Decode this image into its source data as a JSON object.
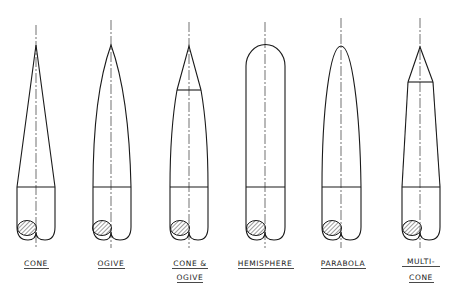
{
  "diagram": {
    "title": "",
    "shapes": [
      {
        "id": "cone",
        "label_lines": [
          "CONE"
        ],
        "nose_type": "cone"
      },
      {
        "id": "ogive",
        "label_lines": [
          "OGIVE"
        ],
        "nose_type": "ogive"
      },
      {
        "id": "cone-ogive",
        "label_lines": [
          "CONE &",
          "OGIVE"
        ],
        "nose_type": "cone-and-ogive"
      },
      {
        "id": "hemisphere",
        "label_lines": [
          "HEMISPHERE"
        ],
        "nose_type": "hemisphere"
      },
      {
        "id": "parabola",
        "label_lines": [
          "PARABOLA"
        ],
        "nose_type": "parabola"
      },
      {
        "id": "multi-cone",
        "label_lines": [
          "MULTI-",
          "CONE"
        ],
        "nose_type": "multi-cone"
      }
    ]
  }
}
